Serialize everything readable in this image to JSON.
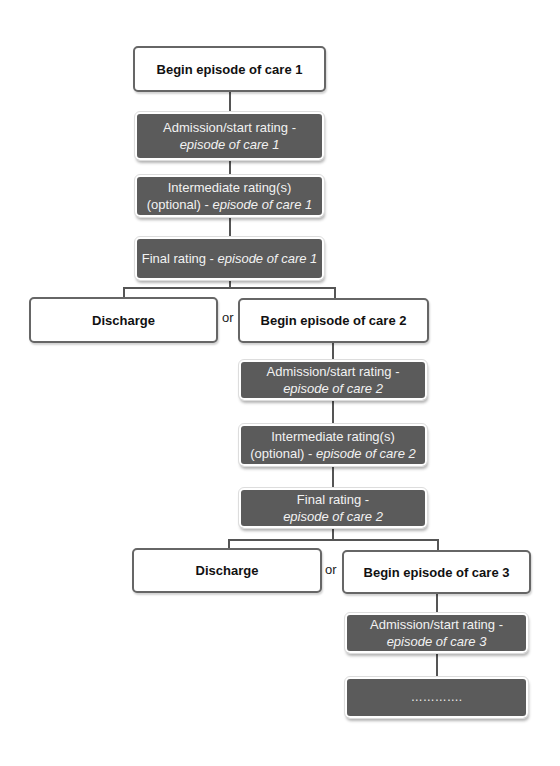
{
  "diagram": {
    "type": "flowchart",
    "colors": {
      "filled_box": "#5b5b5b",
      "outline_box_border": "#666666",
      "connector": "#555555"
    },
    "nodes": {
      "begin_1": {
        "label": "Begin episode of care 1"
      },
      "admission_1": {
        "line1": "Admission/start rating -",
        "line2_italic": "episode of care 1"
      },
      "intermediate_1": {
        "line1": "Intermediate rating(s)",
        "line2_prefix": "(optional) - ",
        "line2_italic": "episode of care 1"
      },
      "final_1": {
        "prefix": "Final rating - ",
        "italic": "episode of care 1"
      },
      "discharge_1": {
        "label": "Discharge"
      },
      "or_1": {
        "label": "or"
      },
      "begin_2": {
        "label": "Begin episode of care 2"
      },
      "admission_2": {
        "line1": "Admission/start rating -",
        "line2_italic": "episode of care 2"
      },
      "intermediate_2": {
        "line1": "Intermediate rating(s)",
        "line2_prefix": "(optional) - ",
        "line2_italic": "episode of care 2"
      },
      "final_2": {
        "line1": "Final rating -",
        "line2_italic": "episode of care 2"
      },
      "discharge_2": {
        "label": "Discharge"
      },
      "or_2": {
        "label": "or"
      },
      "begin_3": {
        "label": "Begin episode of care 3"
      },
      "admission_3": {
        "line1": "Admission/start rating -",
        "line2_italic": "episode of care 3"
      },
      "continuation": {
        "label": "…………."
      }
    },
    "edges": [
      [
        "begin_1",
        "admission_1"
      ],
      [
        "admission_1",
        "intermediate_1"
      ],
      [
        "intermediate_1",
        "final_1"
      ],
      [
        "final_1",
        "discharge_1"
      ],
      [
        "final_1",
        "begin_2"
      ],
      [
        "begin_2",
        "admission_2"
      ],
      [
        "admission_2",
        "intermediate_2"
      ],
      [
        "intermediate_2",
        "final_2"
      ],
      [
        "final_2",
        "discharge_2"
      ],
      [
        "final_2",
        "begin_3"
      ],
      [
        "begin_3",
        "admission_3"
      ],
      [
        "admission_3",
        "continuation"
      ]
    ]
  }
}
